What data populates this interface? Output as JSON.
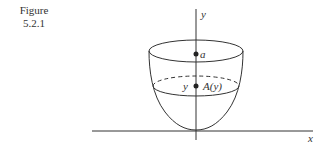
{
  "figure": {
    "caption_line1": "Figure",
    "caption_line2": "5.2.1"
  },
  "diagram": {
    "axis_labels": {
      "y": "y",
      "x": "x"
    },
    "points": [
      {
        "label": "a"
      },
      {
        "label": "A(y)",
        "left_label": "y"
      }
    ],
    "stroke_color": "#333333"
  }
}
